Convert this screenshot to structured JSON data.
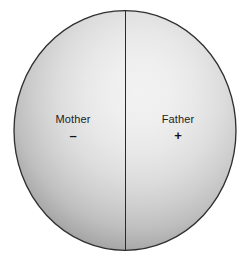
{
  "figure": {
    "title": "",
    "background_color": "#ffffff",
    "cell": {
      "name": "cell-sphere",
      "fill_center_color": "#f2f2f2",
      "fill_edge_color": "#8f8f8f",
      "outline_color": "#2a2a2a"
    },
    "division_line": {
      "name": "vertical-division-line",
      "color": "#2a2a2a"
    },
    "halves": [
      {
        "id": "mother",
        "label": "Mother",
        "sign": "–",
        "sign_name": "minus-sign",
        "side": "left"
      },
      {
        "id": "father",
        "label": "Father",
        "sign": "+",
        "sign_name": "plus-sign",
        "side": "right"
      }
    ]
  }
}
